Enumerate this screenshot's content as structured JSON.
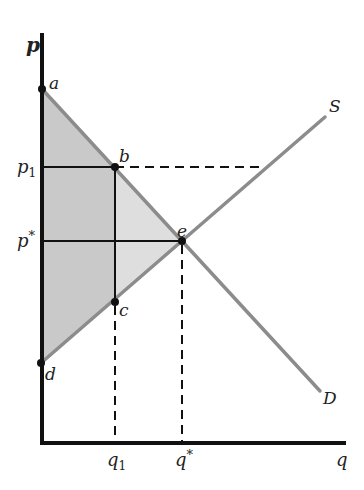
{
  "diagram": {
    "axes": {
      "y_label": "p",
      "x_label": "q"
    },
    "curves": {
      "supply_label": "S",
      "demand_label": "D"
    },
    "points": {
      "a": "a",
      "b": "b",
      "c": "c",
      "d": "d",
      "e": "e"
    },
    "price_ticks": {
      "p1": "p",
      "p1_sub": "1",
      "pstar": "p",
      "pstar_sup": "*"
    },
    "quantity_ticks": {
      "q1": "q",
      "q1_sub": "1",
      "qstar": "q",
      "qstar_sup": "*"
    },
    "colors": {
      "dark_shade": "#c9c9c9",
      "light_shade": "#dedede",
      "curve": "#8c8c8c",
      "axis": "#111111"
    }
  }
}
